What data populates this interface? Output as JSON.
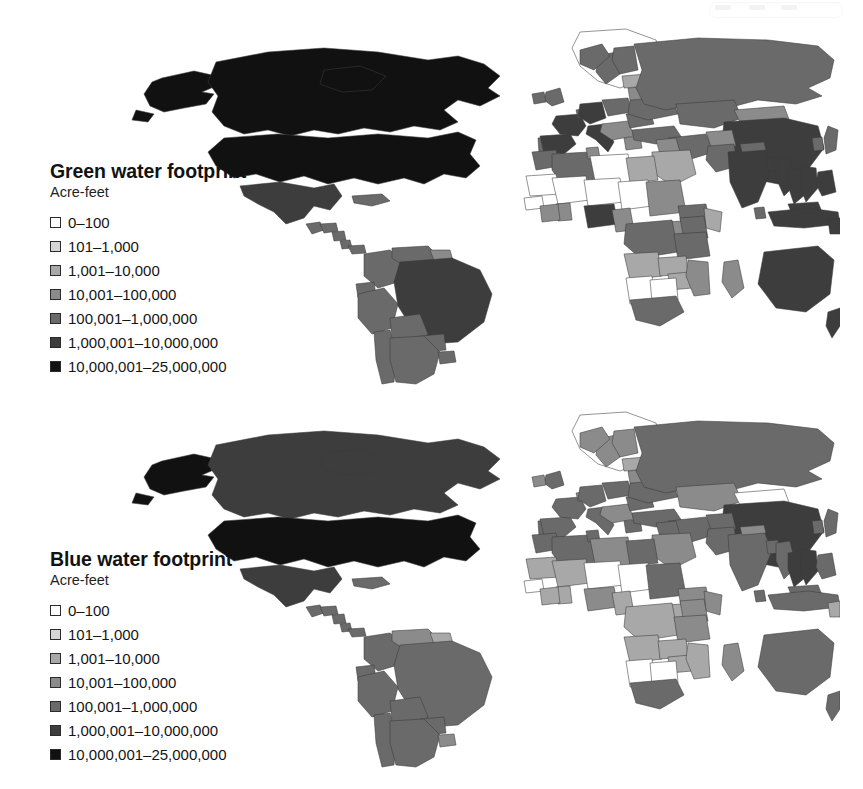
{
  "figure": {
    "type": "choropleth-map-pair",
    "background_color": "#ffffff",
    "page_artifact": "scan-speckle-top-right"
  },
  "palette": {
    "class_0": "#ffffff",
    "class_1": "#d5d5d5",
    "class_2": "#a8a8a8",
    "class_3": "#8b8b8b",
    "class_4": "#6a6a6a",
    "class_5": "#3d3d3d",
    "class_6": "#111111",
    "border": "#3a3a3a"
  },
  "maps": [
    {
      "id": "green",
      "legend": {
        "title": "Green water footprint",
        "units": "Acre-feet",
        "items": [
          {
            "label": "0–100",
            "color": "#ffffff",
            "class": 0
          },
          {
            "label": "101–1,000",
            "color": "#d5d5d5",
            "class": 1
          },
          {
            "label": "1,001–10,000",
            "color": "#a8a8a8",
            "class": 2
          },
          {
            "label": "10,001–100,000",
            "color": "#8b8b8b",
            "class": 3
          },
          {
            "label": "100,001–1,000,000",
            "color": "#6a6a6a",
            "class": 4
          },
          {
            "label": "1,000,001–10,000,000",
            "color": "#3d3d3d",
            "class": 5
          },
          {
            "label": "10,000,001–25,000,000",
            "color": "#111111",
            "class": 6
          }
        ]
      },
      "country_classes": {
        "usa": 6,
        "canada": 6,
        "alaska": 6,
        "mexico": 5,
        "greenland": 0,
        "guatemala": 4,
        "honduras": 4,
        "nicaragua": 4,
        "costarica": 4,
        "panama": 4,
        "cuba": 4,
        "brazil": 5,
        "argentina": 4,
        "colombia": 4,
        "venezuela": 4,
        "peru": 4,
        "bolivia": 4,
        "chile": 4,
        "paraguay": 4,
        "uruguay": 4,
        "ecuador": 4,
        "guyana": 3,
        "russia": 4,
        "china": 5,
        "india": 5,
        "pakistan": 4,
        "kazakhstan": 4,
        "mongolia": 3,
        "iran": 4,
        "turkey": 4,
        "saudi": 2,
        "iraq": 3,
        "afghanistan": 3,
        "indonesia": 5,
        "malaysia": 5,
        "thailand": 5,
        "vietnam": 5,
        "myanmar": 5,
        "philippines": 5,
        "japan": 4,
        "korea": 4,
        "bangladesh": 5,
        "nepal": 4,
        "srilanka": 4,
        "papua": 5,
        "australia": 5,
        "newzealand": 5,
        "france": 5,
        "germany": 5,
        "spain": 5,
        "italy": 5,
        "uk": 4,
        "ireland": 4,
        "poland": 4,
        "ukraine": 4,
        "romania": 4,
        "sweden": 4,
        "norway": 4,
        "finland": 4,
        "belarus": 3,
        "baltics": 2,
        "balkans": 3,
        "greece": 3,
        "portugal": 4,
        "benelux": 4,
        "nigeria": 5,
        "ethiopia": 4,
        "drc": 4,
        "tanzania": 4,
        "kenya": 4,
        "southafrica": 4,
        "sudan": 3,
        "egypt": 2,
        "morocco": 4,
        "algeria": 4,
        "tunisia": 3,
        "libya": 0,
        "ghana": 3,
        "ivorycoast": 3,
        "cameroon": 3,
        "angola": 2,
        "mozambique": 3,
        "madagascar": 3,
        "zambia": 2,
        "zimbabwe": 2,
        "somalia": 2,
        "uganda": 3,
        "mali": 0,
        "niger": 0,
        "chad": 0,
        "mauritania": 0,
        "namibia": 0,
        "botswana": 0,
        "westafrica_small": 0
      }
    },
    {
      "id": "blue",
      "legend": {
        "title": "Blue water footprint",
        "units": "Acre-feet",
        "items": [
          {
            "label": "0–100",
            "color": "#ffffff",
            "class": 0
          },
          {
            "label": "101–1,000",
            "color": "#d5d5d5",
            "class": 1
          },
          {
            "label": "1,001–10,000",
            "color": "#a8a8a8",
            "class": 2
          },
          {
            "label": "10,001–100,000",
            "color": "#8b8b8b",
            "class": 3
          },
          {
            "label": "100,001–1,000,000",
            "color": "#6a6a6a",
            "class": 4
          },
          {
            "label": "1,000,001–10,000,000",
            "color": "#3d3d3d",
            "class": 5
          },
          {
            "label": "10,000,001–25,000,000",
            "color": "#111111",
            "class": 6
          }
        ]
      },
      "country_classes": {
        "usa": 6,
        "canada": 5,
        "alaska": 6,
        "mexico": 5,
        "greenland": 0,
        "guatemala": 4,
        "honduras": 4,
        "nicaragua": 4,
        "costarica": 4,
        "panama": 4,
        "cuba": 4,
        "brazil": 4,
        "argentina": 4,
        "colombia": 4,
        "venezuela": 3,
        "peru": 4,
        "bolivia": 4,
        "chile": 4,
        "paraguay": 4,
        "uruguay": 3,
        "ecuador": 4,
        "guyana": 2,
        "russia": 4,
        "china": 5,
        "india": 4,
        "pakistan": 4,
        "kazakhstan": 3,
        "mongolia": 0,
        "iran": 4,
        "turkey": 4,
        "saudi": 3,
        "iraq": 4,
        "afghanistan": 4,
        "indonesia": 4,
        "malaysia": 4,
        "thailand": 5,
        "vietnam": 5,
        "myanmar": 4,
        "philippines": 4,
        "japan": 4,
        "korea": 4,
        "bangladesh": 4,
        "nepal": 3,
        "srilanka": 4,
        "papua": 2,
        "australia": 4,
        "newzealand": 4,
        "france": 4,
        "germany": 4,
        "spain": 4,
        "italy": 4,
        "uk": 4,
        "ireland": 3,
        "poland": 4,
        "ukraine": 4,
        "romania": 4,
        "sweden": 3,
        "norway": 3,
        "finland": 3,
        "belarus": 3,
        "baltics": 2,
        "balkans": 3,
        "greece": 4,
        "portugal": 4,
        "benelux": 3,
        "nigeria": 3,
        "ethiopia": 3,
        "drc": 2,
        "tanzania": 3,
        "kenya": 3,
        "southafrica": 4,
        "sudan": 4,
        "egypt": 4,
        "morocco": 4,
        "algeria": 4,
        "tunisia": 4,
        "libya": 3,
        "ghana": 2,
        "ivorycoast": 2,
        "cameroon": 2,
        "angola": 2,
        "mozambique": 2,
        "madagascar": 3,
        "zambia": 2,
        "zimbabwe": 2,
        "somalia": 3,
        "uganda": 2,
        "mali": 2,
        "niger": 0,
        "chad": 0,
        "mauritania": 2,
        "namibia": 0,
        "botswana": 0,
        "westafrica_small": 0
      }
    }
  ]
}
